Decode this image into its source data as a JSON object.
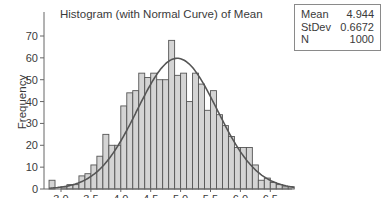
{
  "chart_data": {
    "type": "bar",
    "title": "Histogram (with Normal Curve) of Mean",
    "xlabel": "Mean",
    "ylabel": "Frequency",
    "bin_width": 0.1,
    "bin_starts": [
      2.8,
      2.9,
      3.0,
      3.1,
      3.2,
      3.3,
      3.4,
      3.5,
      3.6,
      3.7,
      3.8,
      3.9,
      4.0,
      4.1,
      4.2,
      4.3,
      4.4,
      4.5,
      4.6,
      4.7,
      4.8,
      4.9,
      5.0,
      5.1,
      5.2,
      5.3,
      5.4,
      5.5,
      5.6,
      5.7,
      5.8,
      5.9,
      6.0,
      6.1,
      6.2,
      6.3,
      6.4,
      6.5,
      6.6,
      6.7,
      6.8
    ],
    "values": [
      4,
      0,
      1,
      2,
      2,
      6,
      7,
      11,
      15,
      25,
      20,
      20,
      38,
      44,
      45,
      53,
      51,
      53,
      50,
      50,
      68,
      52,
      53,
      40,
      53,
      48,
      36,
      45,
      34,
      29,
      24,
      19,
      19,
      19,
      11,
      4,
      5,
      3,
      2,
      1,
      1
    ],
    "xticks": [
      "3.0",
      "3.5",
      "4.0",
      "4.5",
      "5.0",
      "5.5",
      "6.0",
      "6.5"
    ],
    "xtick_values": [
      3.0,
      3.5,
      4.0,
      4.5,
      5.0,
      5.5,
      6.0,
      6.5
    ],
    "yticks": [
      0,
      10,
      20,
      30,
      40,
      50,
      60,
      70
    ],
    "xlim": [
      2.75,
      6.95
    ],
    "ylim": [
      0,
      75
    ],
    "overlay": {
      "type": "normal_curve",
      "mean": 4.944,
      "stdev": 0.6672,
      "n": 1000
    },
    "grid": false,
    "bar_color": "#d4d4d4",
    "bar_edge_color": "#555555",
    "curve_color": "#555555"
  },
  "stats": {
    "rows": [
      {
        "label": "Mean",
        "value": "4.944"
      },
      {
        "label": "StDev",
        "value": "0.6672"
      },
      {
        "label": "N",
        "value": "1000"
      }
    ]
  }
}
